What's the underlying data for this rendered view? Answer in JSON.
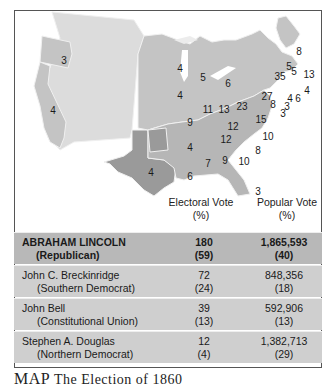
{
  "map": {
    "colors": {
      "lincoln_states": "#c4c4c4",
      "breckinridge_states": "#9a9a9a",
      "territories": "#dcdcdc",
      "borders": "#f0f0f0",
      "frame": "#555555"
    },
    "state_labels": [
      {
        "state": "Oregon",
        "votes": "3"
      },
      {
        "state": "California",
        "votes": "4"
      },
      {
        "state": "Texas",
        "votes": "4"
      },
      {
        "state": "Minnesota",
        "votes": "4"
      },
      {
        "state": "Wisconsin",
        "votes": "5"
      },
      {
        "state": "Michigan",
        "votes": "6"
      },
      {
        "state": "Iowa",
        "votes": "4"
      },
      {
        "state": "Illinois",
        "votes": "11"
      },
      {
        "state": "Indiana",
        "votes": "13"
      },
      {
        "state": "Ohio",
        "votes": "23"
      },
      {
        "state": "Missouri",
        "votes": "9"
      },
      {
        "state": "Kentucky",
        "votes": "12"
      },
      {
        "state": "Tennessee",
        "votes": "12"
      },
      {
        "state": "Virginia",
        "votes": "15"
      },
      {
        "state": "North Carolina",
        "votes": "10"
      },
      {
        "state": "South Carolina",
        "votes": "8"
      },
      {
        "state": "Arkansas",
        "votes": "4"
      },
      {
        "state": "Mississippi",
        "votes": "7"
      },
      {
        "state": "Alabama",
        "votes": "9"
      },
      {
        "state": "Georgia",
        "votes": "10"
      },
      {
        "state": "Louisiana",
        "votes": "6"
      },
      {
        "state": "Florida",
        "votes": "3"
      },
      {
        "state": "Pennsylvania",
        "votes": "27"
      },
      {
        "state": "New York",
        "votes": "35"
      },
      {
        "state": "Maryland",
        "votes": "8"
      },
      {
        "state": "Vermont",
        "votes": "5"
      },
      {
        "state": "New Hampshire",
        "votes": "5"
      },
      {
        "state": "Maine",
        "votes": "8"
      },
      {
        "state": "Massachusetts",
        "votes": "13"
      },
      {
        "state": "Rhode Island",
        "votes": "4"
      },
      {
        "state": "Connecticut",
        "votes": "6"
      },
      {
        "state": "New Jersey",
        "votes": "4"
      },
      {
        "state": "Delaware",
        "votes": "3"
      },
      {
        "state": "Delaware-2",
        "votes": "3"
      }
    ]
  },
  "table": {
    "headers": {
      "electoral": "Electoral Vote",
      "electoral_unit": "(%)",
      "popular": "Popular Vote",
      "popular_unit": "(%)"
    },
    "rows": [
      {
        "candidate": "ABRAHAM LINCOLN",
        "party": "(Republican)",
        "electoral": "180",
        "electoral_pct": "(59)",
        "popular": "1,865,593",
        "popular_pct": "(40)"
      },
      {
        "candidate": "John C. Breckinridge",
        "party": "(Southern Democrat)",
        "electoral": "72",
        "electoral_pct": "(24)",
        "popular": "848,356",
        "popular_pct": "(18)"
      },
      {
        "candidate": "John Bell",
        "party": "(Constitutional Union)",
        "electoral": "39",
        "electoral_pct": "(13)",
        "popular": "592,906",
        "popular_pct": "(13)"
      },
      {
        "candidate": "Stephen A. Douglas",
        "party": "(Northern Democrat)",
        "electoral": "12",
        "electoral_pct": "(4)",
        "popular": "1,382,713",
        "popular_pct": "(29)"
      }
    ]
  },
  "caption": {
    "prefix": "MAP",
    "text": "The Election of 1860"
  }
}
